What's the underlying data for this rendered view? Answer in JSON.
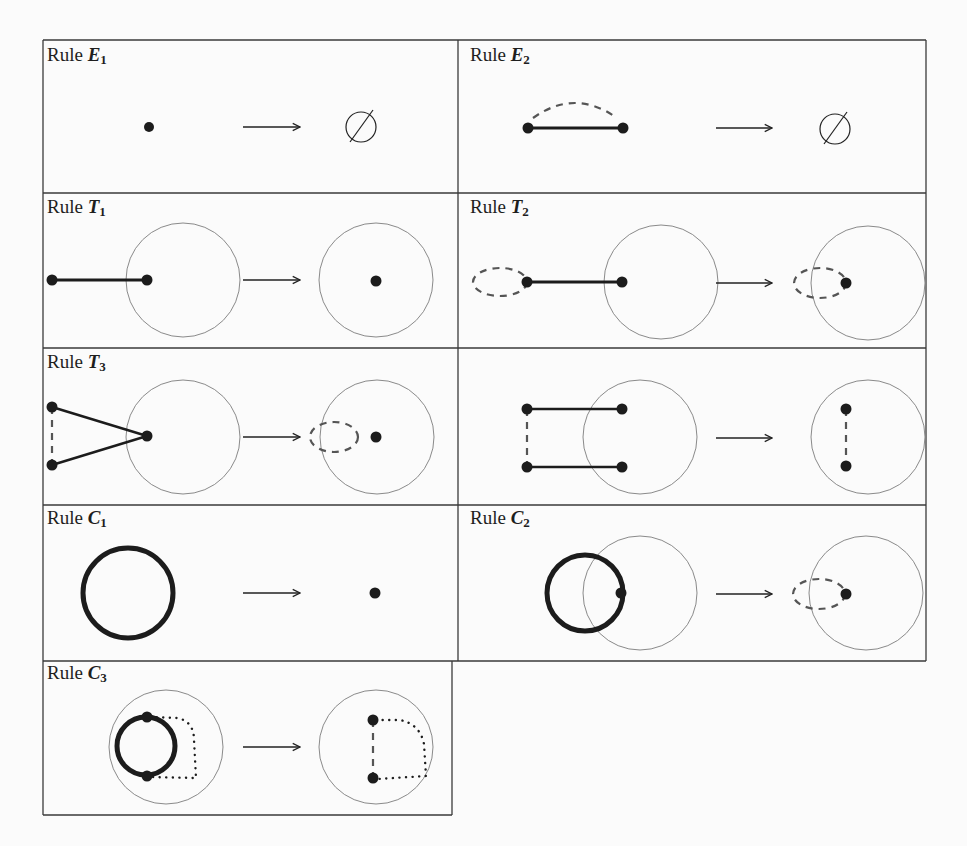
{
  "figure": {
    "colors": {
      "border": "#3a3a3a",
      "ink": "#1c1c1c",
      "dashed": "#555555",
      "region_circle": "#8a8a8a",
      "background": "#fbfbfb"
    },
    "arrow_glyph": "⟶",
    "empty_set_glyph": "∅",
    "rules": [
      {
        "id": "E1",
        "label": "Rule",
        "symbol": "E",
        "subscript": "1",
        "lhs": "single vertex",
        "rhs": "empty set"
      },
      {
        "id": "E2",
        "label": "Rule",
        "symbol": "E",
        "subscript": "2",
        "lhs": "edge between two vertices with dashed arc",
        "rhs": "empty set"
      },
      {
        "id": "T1",
        "label": "Rule",
        "symbol": "T",
        "subscript": "1",
        "lhs": "pendant edge into region",
        "rhs": "single vertex in region"
      },
      {
        "id": "T2",
        "label": "Rule",
        "symbol": "T",
        "subscript": "2",
        "lhs": "dashed loop vertex joined by edge into region",
        "rhs": "vertex in region with dashed loop"
      },
      {
        "id": "T3",
        "label": "Rule",
        "symbol": "T",
        "subscript": "3",
        "lhs": "two vertices joined by dashed edge, both connected to a vertex in region",
        "rhs": "vertex in region with dashed loop"
      },
      {
        "id": "T3b",
        "label": "",
        "symbol": "",
        "subscript": "",
        "lhs": "two parallel edges into region, outer endpoints joined by dashed edge",
        "rhs": "two vertices in region joined by dashed edge"
      },
      {
        "id": "C1",
        "label": "Rule",
        "symbol": "C",
        "subscript": "1",
        "lhs": "bold cycle",
        "rhs": "single vertex"
      },
      {
        "id": "C2",
        "label": "Rule",
        "symbol": "C",
        "subscript": "2",
        "lhs": "bold cycle through vertex in region",
        "rhs": "vertex in region with dashed loop"
      },
      {
        "id": "C3",
        "label": "Rule",
        "symbol": "C",
        "subscript": "3",
        "lhs": "bold cycle with two vertices and dotted path in region",
        "rhs": "two vertices joined by dashed edge and dotted path"
      }
    ]
  }
}
